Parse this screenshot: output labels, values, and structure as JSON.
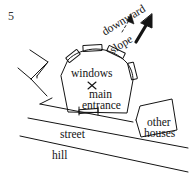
{
  "figure": {
    "number": "5",
    "kind": "hand-drawn site sketch"
  },
  "labels": {
    "windows": "windows",
    "main": "main",
    "entrance": "entrance",
    "street": "street",
    "hill": "hill",
    "other": "other",
    "houses": "houses",
    "downward": "downward",
    "slope": "slope"
  },
  "colors": {
    "ink": "#141414",
    "paper": "#ffffff",
    "figure_number": "#333333"
  },
  "annotations": {
    "center_marker": "x-mark",
    "thin_arrow": "thin-north-arrow",
    "thick_arrow": "thick-north-arrow",
    "window_count": 4
  }
}
